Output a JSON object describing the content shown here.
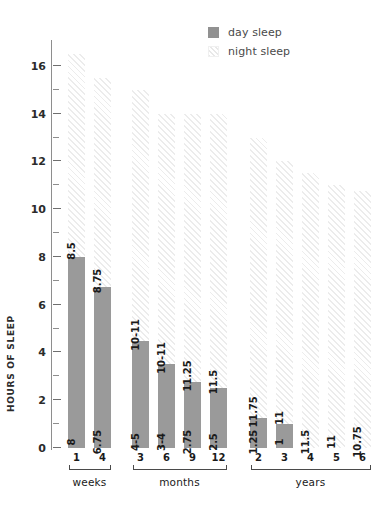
{
  "legend": {
    "position": "top-right",
    "items": [
      {
        "label": "day sleep",
        "swatch": "solid-gray-square",
        "color": "#919191"
      },
      {
        "label": "night sleep",
        "swatch": "hatched-square",
        "color": "#ececec"
      }
    ]
  },
  "axes": {
    "y": {
      "title": "HOURS OF SLEEP",
      "ticks": [
        0,
        2,
        4,
        6,
        8,
        10,
        12,
        14,
        16
      ],
      "minor_step": 1,
      "range": [
        0,
        17
      ]
    },
    "x": {
      "groups": [
        {
          "name": "weeks",
          "ticks": [
            "1",
            "4"
          ]
        },
        {
          "name": "months",
          "ticks": [
            "3",
            "6",
            "9",
            "12"
          ]
        },
        {
          "name": "years",
          "ticks": [
            "2",
            "3",
            "4",
            "5",
            "6"
          ]
        }
      ]
    }
  },
  "chart_data": {
    "type": "bar",
    "title": "",
    "subtitle": "",
    "xlabel": "",
    "ylabel": "HOURS OF SLEEP",
    "ylim": [
      0,
      17
    ],
    "grid": false,
    "stacked": true,
    "legend_position": "top-right",
    "categories": [
      "1 week",
      "4 weeks",
      "3 months",
      "6 months",
      "9 months",
      "12 months",
      "2 years",
      "3 years",
      "4 years",
      "5 years",
      "6 years"
    ],
    "group_labels": [
      "weeks",
      "weeks",
      "months",
      "months",
      "months",
      "months",
      "years",
      "years",
      "years",
      "years",
      "years"
    ],
    "tick_labels": [
      "1",
      "4",
      "3",
      "6",
      "9",
      "12",
      "2",
      "3",
      "4",
      "5",
      "6"
    ],
    "series": [
      {
        "name": "day sleep",
        "color": "#9a9a9a",
        "values": [
          8,
          6.75,
          4.5,
          3.5,
          2.75,
          2.5,
          1.25,
          1,
          0,
          0,
          0
        ],
        "value_labels": [
          "8",
          "6.75",
          "4-5",
          "3-4",
          "2.75",
          "2.5",
          "1.25",
          "1",
          "",
          "",
          ""
        ]
      },
      {
        "name": "night sleep",
        "color": "#ececec",
        "values": [
          8.5,
          8.75,
          10.5,
          10.5,
          11.25,
          11.5,
          11.75,
          11,
          11.5,
          11,
          10.75
        ],
        "value_labels": [
          "8.5",
          "8.75",
          "10-11",
          "10-11",
          "11.25",
          "11.5",
          "11.75",
          "11",
          "11.5",
          "11",
          "10.75"
        ]
      }
    ],
    "totals": [
      16.5,
      15.5,
      15,
      14,
      14,
      14,
      13,
      12,
      11.5,
      11,
      10.75
    ]
  }
}
